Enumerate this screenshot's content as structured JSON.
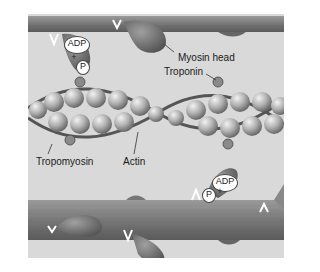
{
  "figure": {
    "type": "diagram"
  },
  "labels": {
    "myosin_head": "Myosin head",
    "troponin": "Troponin",
    "tropomyosin": "Tropomyosin",
    "actin": "Actin"
  },
  "molecules": {
    "top": {
      "adp": "ADP",
      "plus": "+",
      "p": "P"
    },
    "bottom": {
      "adp": "ADP",
      "plus": "+",
      "p": "P"
    }
  },
  "colors": {
    "background": "#ffffff",
    "panel": "#d9d9d9",
    "filament": "#7a7a7a",
    "myosin_head": "#6e6e6e",
    "actin_bead": "#a8a8a8"
  }
}
